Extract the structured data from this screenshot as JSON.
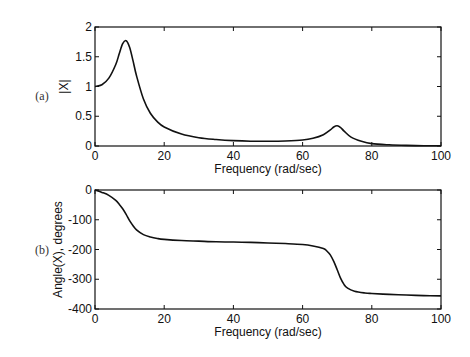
{
  "chart_data": [
    {
      "type": "line",
      "panel_label": "(a)",
      "title": "",
      "xlabel": "Frequency (rad/sec)",
      "ylabel": "|X|",
      "xlim": [
        0,
        100
      ],
      "ylim": [
        0,
        2
      ],
      "xticks": [
        0,
        20,
        40,
        60,
        80,
        100
      ],
      "yticks": [
        0,
        0.5,
        1,
        1.5,
        2
      ],
      "xtick_labels": [
        "0",
        "20",
        "40",
        "60",
        "80",
        "100"
      ],
      "ytick_labels": [
        "0",
        "0.5",
        "1",
        "1.5",
        "2"
      ],
      "grid": false,
      "annotations": [
        "resonance peak ~1.77 at ~9 rad/sec",
        "secondary peak ~0.34 at ~70 rad/sec"
      ],
      "x": [
        0,
        2,
        4,
        6,
        7,
        8,
        9,
        10,
        11,
        12,
        14,
        16,
        18,
        20,
        25,
        30,
        35,
        40,
        45,
        50,
        55,
        60,
        63,
        66,
        68,
        69,
        70,
        71,
        72,
        74,
        77,
        80,
        85,
        90,
        95,
        100
      ],
      "values": [
        1.0,
        1.03,
        1.14,
        1.37,
        1.55,
        1.72,
        1.77,
        1.66,
        1.43,
        1.18,
        0.79,
        0.55,
        0.41,
        0.32,
        0.2,
        0.14,
        0.11,
        0.09,
        0.08,
        0.08,
        0.085,
        0.1,
        0.13,
        0.19,
        0.27,
        0.32,
        0.34,
        0.31,
        0.25,
        0.15,
        0.08,
        0.04,
        0.02,
        0.01,
        0.005,
        0.003
      ]
    },
    {
      "type": "line",
      "panel_label": "(b)",
      "title": "",
      "xlabel": "Frequency (rad/sec)",
      "ylabel": "Angle(X), degrees",
      "xlim": [
        0,
        100
      ],
      "ylim": [
        -400,
        0
      ],
      "xticks": [
        0,
        20,
        40,
        60,
        80,
        100
      ],
      "yticks": [
        -400,
        -300,
        -200,
        -100,
        0
      ],
      "xtick_labels": [
        "0",
        "20",
        "40",
        "60",
        "80",
        "100"
      ],
      "ytick_labels": [
        "-400",
        "-300",
        "-200",
        "-100",
        "0"
      ],
      "grid": false,
      "x": [
        0,
        2,
        4,
        6,
        7,
        8,
        9,
        10,
        11,
        12,
        14,
        16,
        18,
        20,
        25,
        30,
        35,
        40,
        45,
        50,
        55,
        60,
        63,
        66,
        67,
        68,
        69,
        70,
        71,
        72,
        73,
        75,
        78,
        80,
        85,
        90,
        95,
        100
      ],
      "values": [
        0,
        -8,
        -18,
        -35,
        -48,
        -63,
        -82,
        -103,
        -120,
        -134,
        -150,
        -158,
        -163,
        -166,
        -170,
        -172,
        -174,
        -175,
        -176,
        -178,
        -180,
        -183,
        -188,
        -197,
        -205,
        -218,
        -240,
        -268,
        -297,
        -318,
        -330,
        -340,
        -346,
        -348,
        -351,
        -353,
        -355,
        -356
      ]
    }
  ],
  "panels": {
    "a": {
      "label": "(a)"
    },
    "b": {
      "label": "(b)"
    }
  },
  "style": {
    "line_color": "#111111",
    "axis_color": "#111111",
    "background": "#ffffff"
  }
}
